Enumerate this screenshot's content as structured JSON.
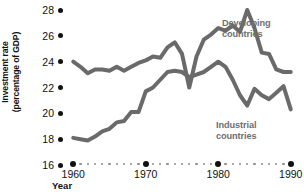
{
  "chart_data": {
    "type": "line",
    "title": "",
    "xlabel": "Year",
    "ylabel": "Investment rate\n(percentage of GDP)",
    "ylim": [
      16,
      28
    ],
    "xlim": [
      1959,
      1991
    ],
    "ytick_labels": [
      "28",
      "26",
      "24",
      "22",
      "20",
      "18",
      "16"
    ],
    "yticks": [
      28,
      26,
      24,
      22,
      20,
      18,
      16
    ],
    "xtick_labels": [
      "1960",
      "1970",
      "1980",
      "1990"
    ],
    "xticks": [
      1960,
      1970,
      1980,
      1990
    ],
    "minor_xticks": [
      1961,
      1962,
      1963,
      1964,
      1965,
      1966,
      1967,
      1968,
      1969,
      1971,
      1972,
      1973,
      1974,
      1975,
      1976,
      1977,
      1978,
      1979,
      1981,
      1982,
      1983,
      1984,
      1985,
      1986,
      1987,
      1988,
      1989
    ],
    "grid": false,
    "legend_position": "inline-annotations",
    "line_color": "#6a6a6a",
    "line_width": 4,
    "axis_color": "#111111",
    "x": [
      1960,
      1961,
      1962,
      1963,
      1964,
      1965,
      1966,
      1967,
      1968,
      1969,
      1970,
      1971,
      1972,
      1973,
      1974,
      1975,
      1976,
      1977,
      1978,
      1979,
      1980,
      1981,
      1982,
      1983,
      1984,
      1985,
      1986,
      1987,
      1988,
      1989,
      1990
    ],
    "series": [
      {
        "name": "Developing countries",
        "label_text": "Developing\ncountries",
        "values": [
          24.0,
          23.6,
          23.1,
          23.4,
          23.4,
          23.3,
          23.6,
          23.3,
          23.6,
          23.9,
          24.1,
          24.4,
          24.3,
          25.1,
          25.5,
          24.6,
          22.0,
          24.4,
          25.7,
          26.1,
          26.6,
          26.4,
          26.8,
          26.3,
          28.0,
          26.6,
          24.7,
          24.6,
          23.4,
          23.2,
          23.2
        ]
      },
      {
        "name": "Industrial countries",
        "label_text": "Industrial\ncountries",
        "values": [
          18.1,
          18.0,
          17.9,
          18.2,
          18.6,
          18.8,
          19.3,
          19.4,
          20.1,
          20.1,
          21.7,
          22.0,
          22.6,
          23.2,
          23.3,
          23.2,
          22.8,
          23.0,
          23.2,
          23.6,
          24.0,
          23.6,
          22.6,
          21.4,
          20.6,
          21.9,
          21.4,
          21.1,
          21.6,
          22.1,
          20.3
        ]
      }
    ]
  }
}
